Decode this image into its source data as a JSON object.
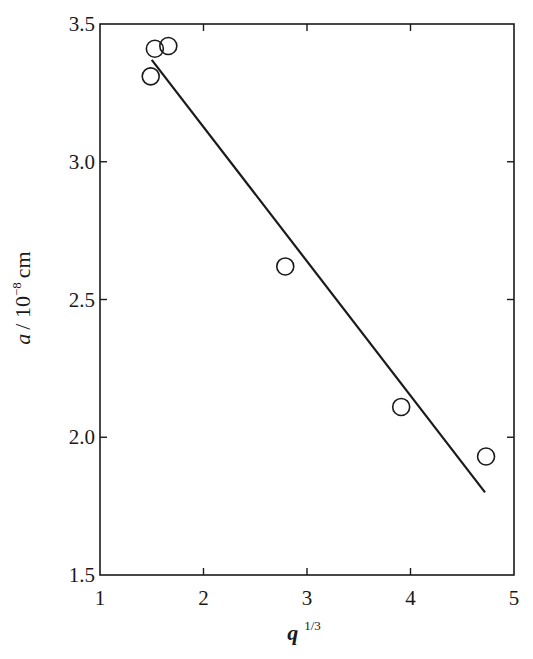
{
  "chart_data": {
    "type": "scatter",
    "title": "",
    "xlabel": "q",
    "xlabel_superscript": "1/3",
    "ylabel": "a",
    "ylabel_unit": "/ 10",
    "ylabel_exponent": "−8",
    "ylabel_unit_suffix": "cm",
    "xlim": [
      1,
      5
    ],
    "ylim": [
      1.5,
      3.5
    ],
    "x_ticks": [
      1,
      2,
      3,
      4,
      5
    ],
    "x_tick_labels": [
      "1",
      "2",
      "3",
      "4",
      "5"
    ],
    "y_ticks": [
      1.5,
      2.0,
      2.5,
      3.0,
      3.5
    ],
    "y_tick_labels": [
      "1.5",
      "2.0",
      "2.5",
      "3.0",
      "3.5"
    ],
    "grid": false,
    "legend": null,
    "series": [
      {
        "name": "data",
        "marker": "open-circle",
        "points": [
          {
            "x": 1.49,
            "y": 3.31
          },
          {
            "x": 1.53,
            "y": 3.41
          },
          {
            "x": 1.66,
            "y": 3.42
          },
          {
            "x": 2.79,
            "y": 2.62
          },
          {
            "x": 3.91,
            "y": 2.11
          },
          {
            "x": 4.73,
            "y": 1.93
          }
        ]
      },
      {
        "name": "linear fit",
        "marker": "line",
        "points": [
          {
            "x": 1.5,
            "y": 3.37
          },
          {
            "x": 4.72,
            "y": 1.8
          }
        ]
      }
    ]
  },
  "colors": {
    "ink": "#1a1a1a",
    "background": "#ffffff"
  }
}
